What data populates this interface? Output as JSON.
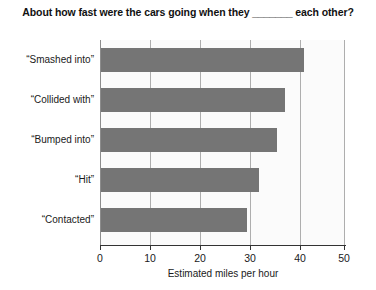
{
  "chart_data": {
    "type": "bar",
    "orientation": "horizontal",
    "title": "About how fast were the cars going when they _______ each other?",
    "xlabel": "Estimated miles per hour",
    "ylabel": "",
    "categories": [
      "“Smashed into”",
      "“Collided with”",
      "“Bumped into”",
      "“Hit”",
      "“Contacted”"
    ],
    "values": [
      41.8,
      38.0,
      36.2,
      32.6,
      30.2
    ],
    "xlim": [
      0,
      50
    ],
    "ylim": null,
    "xticks": [
      0,
      10,
      20,
      30,
      40,
      50
    ],
    "xtick_labels": [
      "0",
      "10",
      "20",
      "30",
      "40",
      "50"
    ],
    "grid": "vertical",
    "legend": null,
    "bar_color": "#757575",
    "plot_background": "#fbfbfb",
    "gridline_color": "#aeaeae",
    "axis_color": "#333333"
  }
}
